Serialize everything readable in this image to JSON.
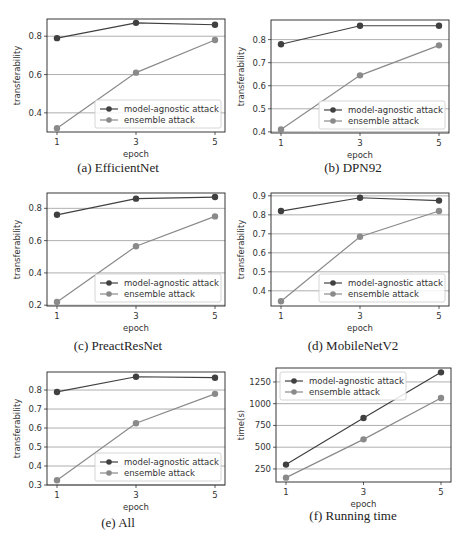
{
  "chart_data": [
    {
      "id": "a",
      "type": "line",
      "caption": "(a) EfficientNet",
      "title": "",
      "xlabel": "epoch",
      "ylabel": "transferability",
      "x": [
        1,
        3,
        5
      ],
      "xticks": [
        "1",
        "3",
        "5"
      ],
      "yticks": [
        0.4,
        0.6,
        0.8
      ],
      "ytick_labels": [
        "0.4",
        "0.6",
        "0.8"
      ],
      "ylim": [
        0.3,
        0.89
      ],
      "grid": "horizontal",
      "legend_position": "lower right",
      "series": [
        {
          "name": "model-agnostic attack",
          "values": [
            0.79,
            0.87,
            0.86
          ],
          "color": "#404040"
        },
        {
          "name": "ensemble attack",
          "values": [
            0.32,
            0.61,
            0.78
          ],
          "color": "#8a8a8a"
        }
      ]
    },
    {
      "id": "b",
      "type": "line",
      "caption": "(b) DPN92",
      "title": "",
      "xlabel": "epoch",
      "ylabel": "transferability",
      "x": [
        1,
        3,
        5
      ],
      "xticks": [
        "1",
        "3",
        "5"
      ],
      "yticks": [
        0.4,
        0.5,
        0.6,
        0.7,
        0.8
      ],
      "ytick_labels": [
        "0.4",
        "0.5",
        "0.6",
        "0.7",
        "0.8"
      ],
      "ylim": [
        0.395,
        0.885
      ],
      "grid": "horizontal",
      "legend_position": "lower right",
      "series": [
        {
          "name": "model-agnostic attack",
          "values": [
            0.78,
            0.86,
            0.86
          ],
          "color": "#404040"
        },
        {
          "name": "ensemble attack",
          "values": [
            0.41,
            0.645,
            0.775
          ],
          "color": "#8a8a8a"
        }
      ]
    },
    {
      "id": "c",
      "type": "line",
      "caption": "(c) PreactResNet",
      "title": "",
      "xlabel": "epoch",
      "ylabel": "transferability",
      "x": [
        1,
        3,
        5
      ],
      "xticks": [
        "1",
        "3",
        "5"
      ],
      "yticks": [
        0.2,
        0.4,
        0.6,
        0.8
      ],
      "ytick_labels": [
        "0.2",
        "0.4",
        "0.6",
        "0.8"
      ],
      "ylim": [
        0.195,
        0.895
      ],
      "grid": "horizontal",
      "legend_position": "lower right",
      "series": [
        {
          "name": "model-agnostic attack",
          "values": [
            0.76,
            0.86,
            0.87
          ],
          "color": "#404040"
        },
        {
          "name": "ensemble attack",
          "values": [
            0.22,
            0.565,
            0.75
          ],
          "color": "#8a8a8a"
        }
      ]
    },
    {
      "id": "d",
      "type": "line",
      "caption": "(d) MobileNetV2",
      "title": "",
      "xlabel": "epoch",
      "ylabel": "transferability",
      "x": [
        1,
        3,
        5
      ],
      "xticks": [
        "1",
        "3",
        "5"
      ],
      "yticks": [
        0.4,
        0.5,
        0.6,
        0.7,
        0.8,
        0.9
      ],
      "ytick_labels": [
        "0.4",
        "0.5",
        "0.6",
        "0.7",
        "0.8",
        "0.9"
      ],
      "ylim": [
        0.32,
        0.915
      ],
      "grid": "horizontal",
      "legend_position": "lower right",
      "series": [
        {
          "name": "model-agnostic attack",
          "values": [
            0.82,
            0.89,
            0.875
          ],
          "color": "#404040"
        },
        {
          "name": "ensemble attack",
          "values": [
            0.345,
            0.685,
            0.82
          ],
          "color": "#8a8a8a"
        }
      ]
    },
    {
      "id": "e",
      "type": "line",
      "caption": "(e) All",
      "title": "",
      "xlabel": "epoch",
      "ylabel": "transferability",
      "x": [
        1,
        3,
        5
      ],
      "xticks": [
        "1",
        "3",
        "5"
      ],
      "yticks": [
        0.3,
        0.4,
        0.5,
        0.6,
        0.7,
        0.8
      ],
      "ytick_labels": [
        "0.3",
        "0.4",
        "0.5",
        "0.6",
        "0.7",
        "0.8"
      ],
      "ylim": [
        0.3,
        0.895
      ],
      "grid": "horizontal",
      "legend_position": "lower right",
      "series": [
        {
          "name": "model-agnostic attack",
          "values": [
            0.79,
            0.87,
            0.865
          ],
          "color": "#404040"
        },
        {
          "name": "ensemble attack",
          "values": [
            0.325,
            0.625,
            0.78
          ],
          "color": "#8a8a8a"
        }
      ]
    },
    {
      "id": "f",
      "type": "line",
      "caption": "(f) Running time",
      "title": "",
      "xlabel": "epoch",
      "ylabel": "time(s)",
      "x": [
        1,
        3,
        5
      ],
      "xticks": [
        "1",
        "3",
        "5"
      ],
      "yticks": [
        250,
        500,
        750,
        1000,
        1250
      ],
      "ytick_labels": [
        "250",
        "500",
        "750",
        "1000",
        "1250"
      ],
      "ylim": [
        100,
        1410
      ],
      "grid": "horizontal",
      "legend_position": "upper left",
      "series": [
        {
          "name": "model-agnostic attack",
          "values": [
            300,
            835,
            1360
          ],
          "color": "#404040"
        },
        {
          "name": "ensemble attack",
          "values": [
            150,
            590,
            1065
          ],
          "color": "#8a8a8a"
        }
      ]
    }
  ],
  "layout": {
    "panels": [
      {
        "id": "a",
        "left": 0,
        "top": 0,
        "plot": {
          "x": 47,
          "y": 19,
          "w": 178,
          "h": 113
        },
        "caption_top": 160
      },
      {
        "id": "b",
        "left": 235,
        "top": 0,
        "plot": {
          "x": 36,
          "y": 20,
          "w": 178,
          "h": 113
        },
        "caption_top": 160
      },
      {
        "id": "c",
        "left": 0,
        "top": 175,
        "plot": {
          "x": 47,
          "y": 18,
          "w": 178,
          "h": 113
        },
        "caption_top": 163
      },
      {
        "id": "d",
        "left": 235,
        "top": 175,
        "plot": {
          "x": 36,
          "y": 18,
          "w": 178,
          "h": 113
        },
        "caption_top": 163
      },
      {
        "id": "e",
        "left": 0,
        "top": 360,
        "plot": {
          "x": 47,
          "y": 12,
          "w": 178,
          "h": 113
        },
        "caption_top": 155
      },
      {
        "id": "f",
        "left": 235,
        "top": 360,
        "plot": {
          "x": 41,
          "y": 8,
          "w": 175,
          "h": 114
        },
        "caption_top": 148
      }
    ]
  }
}
